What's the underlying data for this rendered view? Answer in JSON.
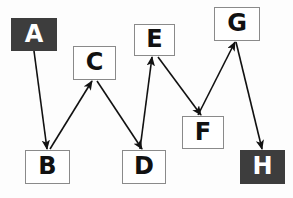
{
  "diagram": {
    "type": "directed-graph",
    "canvas": {
      "width": 293,
      "height": 198,
      "background": "#fdfdfd"
    },
    "styles": {
      "node_fill_light": "#ffffff",
      "node_fill_dark": "#3d3d3d",
      "node_border": "#8a8a8a",
      "text_light": "#111111",
      "text_dark": "#ffffff",
      "edge_color": "#111111"
    },
    "nodes": [
      {
        "id": "A",
        "label": "A",
        "x": 11,
        "y": 18,
        "w": 46,
        "h": 33,
        "shade": "dark"
      },
      {
        "id": "C",
        "label": "C",
        "x": 73,
        "y": 46,
        "w": 43,
        "h": 34,
        "shade": "light"
      },
      {
        "id": "E",
        "label": "E",
        "x": 134,
        "y": 24,
        "w": 41,
        "h": 32,
        "shade": "light"
      },
      {
        "id": "G",
        "label": "G",
        "x": 214,
        "y": 7,
        "w": 46,
        "h": 34,
        "shade": "light"
      },
      {
        "id": "B",
        "label": "B",
        "x": 25,
        "y": 150,
        "w": 45,
        "h": 34,
        "shade": "light"
      },
      {
        "id": "D",
        "label": "D",
        "x": 122,
        "y": 150,
        "w": 44,
        "h": 34,
        "shade": "light"
      },
      {
        "id": "F",
        "label": "F",
        "x": 182,
        "y": 116,
        "w": 42,
        "h": 33,
        "shade": "light"
      },
      {
        "id": "H",
        "label": "H",
        "x": 240,
        "y": 150,
        "w": 45,
        "h": 34,
        "shade": "dark"
      }
    ],
    "edges": [
      {
        "id": "A-B",
        "from": "A",
        "to": "B",
        "x1": 34,
        "y1": 51,
        "x2": 47,
        "y2": 149,
        "arrow": "to"
      },
      {
        "id": "B-C",
        "from": "B",
        "to": "C",
        "x1": 50,
        "y1": 149,
        "x2": 92,
        "y2": 81,
        "arrow": "to"
      },
      {
        "id": "C-D",
        "from": "C",
        "to": "D",
        "x1": 97,
        "y1": 81,
        "x2": 142,
        "y2": 149,
        "arrow": "to"
      },
      {
        "id": "D-E",
        "from": "D",
        "to": "E",
        "x1": 140,
        "y1": 149,
        "x2": 152,
        "y2": 57,
        "arrow": "to"
      },
      {
        "id": "E-F",
        "from": "E",
        "to": "F",
        "x1": 158,
        "y1": 57,
        "x2": 201,
        "y2": 115,
        "arrow": "to"
      },
      {
        "id": "F-G",
        "from": "F",
        "to": "G",
        "x1": 198,
        "y1": 115,
        "x2": 235,
        "y2": 42,
        "arrow": "to"
      },
      {
        "id": "G-H",
        "from": "G",
        "to": "H",
        "x1": 236,
        "y1": 42,
        "x2": 262,
        "y2": 149,
        "arrow": "to"
      }
    ]
  }
}
